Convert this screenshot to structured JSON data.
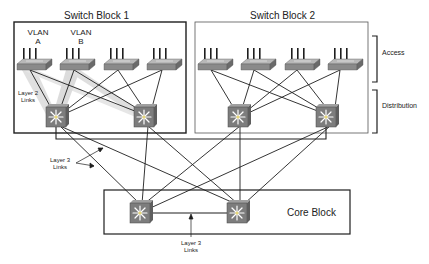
{
  "diagram": {
    "blocks": [
      {
        "id": "switch-block-1",
        "label": "Switch Block 1"
      },
      {
        "id": "switch-block-2",
        "label": "Switch Block 2"
      },
      {
        "id": "core-block",
        "label": "Core Block"
      }
    ],
    "tiers": {
      "access": "Access",
      "distribution": "Distribution"
    },
    "vlans": [
      {
        "line1": "VLAN",
        "line2": "A"
      },
      {
        "line1": "VLAN",
        "line2": "B"
      }
    ],
    "annotations": {
      "layer2_links": {
        "line1": "Layer 2",
        "line2": "Links"
      },
      "layer3_links_left": {
        "line1": "Layer 3",
        "line2": "Links"
      },
      "layer3_links_core": {
        "line1": "Layer 3",
        "line2": "Links"
      }
    },
    "colors": {
      "line": "#1e1e1e",
      "switch_body": "#8a8a8a",
      "switch_top": "#b4b4b4",
      "multilayer_body": "#7d7d7d",
      "highlight": "#c8c8c8"
    }
  }
}
